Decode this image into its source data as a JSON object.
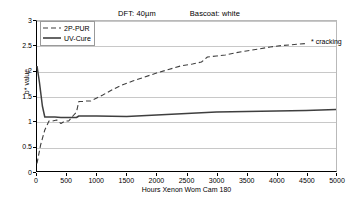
{
  "header": {
    "dft_label": "DFT: 40µm",
    "basecoat_label": "Bascoat: white"
  },
  "annotation": {
    "cracking_label": "* cracking"
  },
  "chart_data": {
    "type": "line",
    "title": "",
    "subtitle_items": [
      "DFT: 40µm",
      "Bascoat: white"
    ],
    "xlabel": "Hours Xenon Wom Cam 180",
    "ylabel": "b* value",
    "xlim": [
      0,
      5000
    ],
    "ylim": [
      0,
      3
    ],
    "xticks": [
      0,
      500,
      1000,
      1500,
      2000,
      2500,
      3000,
      3500,
      4000,
      4500,
      5000
    ],
    "xtick_labels": [
      "0",
      "500",
      "1000",
      "1500",
      "2000",
      "2500",
      "3000",
      "3500",
      "4000",
      "4500",
      "5000"
    ],
    "yticks": [
      0,
      0.5,
      1,
      1.5,
      2,
      2.5,
      3
    ],
    "ytick_labels": [
      "0",
      "0.5",
      "1",
      "1.5",
      "2",
      "2.5",
      "3"
    ],
    "grid": "horizontal",
    "legend_position": "top-left",
    "annotations": [
      {
        "text": "* cracking",
        "x": 4500,
        "y": 2.55
      }
    ],
    "series": [
      {
        "name": "2P-PUR",
        "style": "dashed",
        "color": "#3f3f3f",
        "x": [
          0,
          60,
          130,
          200,
          260,
          330,
          400,
          470,
          530,
          600,
          660,
          700,
          760,
          830,
          900,
          1000,
          1100,
          1250,
          1400,
          1600,
          1800,
          2000,
          2200,
          2400,
          2600,
          2750,
          2850,
          3000,
          3150,
          3300,
          3500,
          3700,
          3900,
          4100,
          4300,
          4500
        ],
        "y": [
          0.15,
          0.52,
          0.82,
          1.0,
          1.0,
          1.02,
          0.95,
          1.0,
          1.0,
          1.1,
          1.18,
          1.39,
          1.39,
          1.4,
          1.4,
          1.46,
          1.52,
          1.62,
          1.71,
          1.8,
          1.88,
          1.96,
          2.03,
          2.1,
          2.14,
          2.18,
          2.28,
          2.3,
          2.32,
          2.36,
          2.4,
          2.44,
          2.48,
          2.51,
          2.53,
          2.55
        ]
      },
      {
        "name": "UV-Cure",
        "style": "solid",
        "color": "#3f3f3f",
        "x": [
          0,
          40,
          90,
          130,
          300,
          400,
          500,
          600,
          660,
          700,
          1000,
          1500,
          2000,
          2500,
          3000,
          3500,
          4000,
          4500,
          5000
        ],
        "y": [
          2.1,
          1.78,
          1.3,
          1.08,
          1.08,
          1.07,
          1.07,
          1.07,
          1.07,
          1.1,
          1.1,
          1.09,
          1.12,
          1.15,
          1.18,
          1.19,
          1.2,
          1.21,
          1.23
        ]
      }
    ]
  }
}
